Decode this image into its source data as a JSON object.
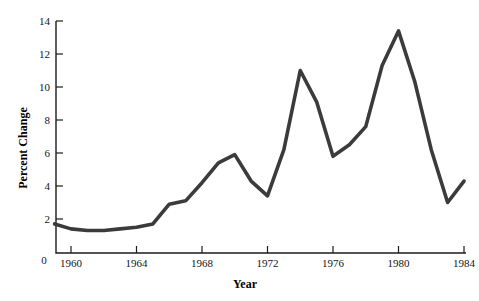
{
  "chart_data": {
    "type": "line",
    "title": "",
    "xlabel": "Year",
    "ylabel": "Percent Change",
    "xlim": [
      1959,
      1984.5
    ],
    "ylim": [
      0,
      14
    ],
    "grid": false,
    "legend": "none",
    "line_color": "#3b3b3b",
    "axis_color": "#1c1c1c",
    "x_ticks": [
      1960,
      1964,
      1968,
      1972,
      1976,
      1980,
      1984
    ],
    "x_tick_labels": [
      "1960",
      "1964",
      "1968",
      "1972",
      "1976",
      "1980",
      "1984"
    ],
    "y_ticks": [
      0,
      2,
      4,
      6,
      8,
      10,
      12,
      14
    ],
    "y_tick_labels": [
      "0",
      "2",
      "4",
      "6",
      "8",
      "10",
      "12",
      "14"
    ],
    "origin_label": "0",
    "x": [
      1959,
      1960,
      1961,
      1962,
      1963,
      1964,
      1965,
      1966,
      1967,
      1968,
      1969,
      1970,
      1971,
      1972,
      1973,
      1974,
      1975,
      1976,
      1977,
      1978,
      1979,
      1980,
      1981,
      1982,
      1983,
      1984
    ],
    "values": [
      1.7,
      1.4,
      1.3,
      1.3,
      1.4,
      1.5,
      1.7,
      2.9,
      3.1,
      4.2,
      5.4,
      5.9,
      4.3,
      3.4,
      6.2,
      11.0,
      9.1,
      5.8,
      6.5,
      7.6,
      11.3,
      13.4,
      10.3,
      6.2,
      3.0,
      4.3
    ],
    "series_name": "Percent Change",
    "annotations": []
  }
}
